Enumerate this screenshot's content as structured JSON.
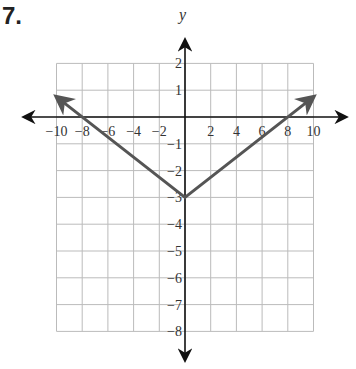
{
  "problem": {
    "number": "7."
  },
  "chart_data": {
    "type": "line",
    "title": "",
    "xlabel": "x",
    "ylabel": "y",
    "xlim": [
      -10,
      10
    ],
    "ylim": [
      -8,
      2
    ],
    "grid": true,
    "x_ticks": [
      -10,
      -8,
      -6,
      -4,
      -2,
      2,
      4,
      6,
      8,
      10
    ],
    "x_tick_labels": [
      "−10",
      "−8",
      "−6",
      "−4",
      "−2",
      "2",
      "4",
      "6",
      "8",
      "10"
    ],
    "y_ticks": [
      2,
      1,
      -1,
      -2,
      -3,
      -4,
      -5,
      -6,
      -7,
      -8
    ],
    "y_tick_labels": [
      "2",
      "1",
      "−1",
      "−2",
      "−3",
      "−4",
      "−5",
      "−6",
      "−7",
      "−8"
    ],
    "series": [
      {
        "name": "y = (3/8)|x| - 3",
        "x": [
          -10,
          0,
          10
        ],
        "y": [
          0.75,
          -3,
          0.75
        ],
        "arrows": "both-ends",
        "color": "#555555"
      }
    ],
    "vertex": {
      "x": 0,
      "y": -3
    },
    "x_intercepts": [
      -8,
      8
    ],
    "colors": {
      "grid": "#bbbbbb",
      "axes": "#111111",
      "graph": "#555555"
    }
  }
}
